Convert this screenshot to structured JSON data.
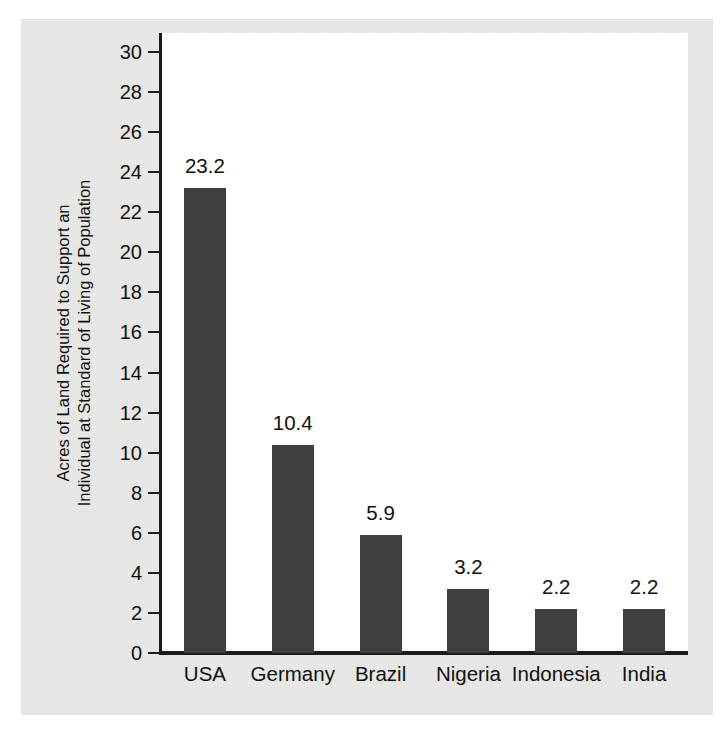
{
  "chart_data": {
    "type": "bar",
    "title": "",
    "subtitle": "",
    "xlabel": "",
    "ylabel_lines": [
      "Acres of Land Required to Support an",
      "Individual at Standard of Living of Population"
    ],
    "ylabel": "Acres of Land Required to Support an Individual at Standard of Living of Population",
    "categories": [
      "USA",
      "Germany",
      "Brazil",
      "Nigeria",
      "Indonesia",
      "India"
    ],
    "values": [
      23.2,
      10.4,
      5.9,
      3.2,
      2.2,
      2.2
    ],
    "value_labels": [
      "23.2",
      "10.4",
      "5.9",
      "3.2",
      "2.2",
      "2.2"
    ],
    "ylim": [
      0,
      30
    ],
    "ytick_values": [
      0,
      2,
      4,
      6,
      8,
      10,
      12,
      14,
      16,
      18,
      20,
      22,
      24,
      26,
      28,
      30
    ],
    "ytick_labels": [
      "0",
      "2",
      "4",
      "6",
      "8",
      "10",
      "12",
      "14",
      "16",
      "18",
      "20",
      "22",
      "24",
      "26",
      "28",
      "30"
    ],
    "ytick_step": 2,
    "grid": false,
    "legend": false,
    "legend_position": "none",
    "bar_color": "#3f3f3f",
    "axis_color": "#1a1a1a",
    "plot_background": "#ffffff",
    "page_background": "#e9e9e7",
    "data_labels_shown": true
  }
}
